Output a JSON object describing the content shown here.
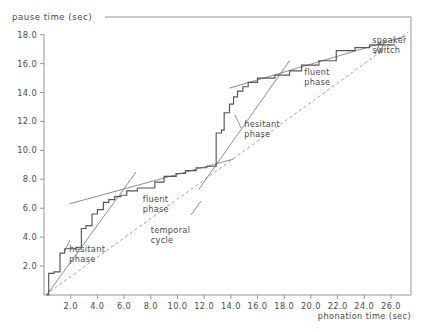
{
  "chart_data": {
    "type": "line",
    "title": "pause time (sec)",
    "xlabel": "phonation time (sec)",
    "ylabel": "pause time (sec)",
    "xlim": [
      0,
      27.5
    ],
    "ylim": [
      0,
      18.6
    ],
    "grid": false,
    "legend": null,
    "xticks": [
      "2.0",
      "4.0",
      "6.0",
      "8.0",
      "10.0",
      "12.0",
      "14.0",
      "16.0",
      "18.0",
      "20.0",
      "22.0",
      "24.0",
      "26.0"
    ],
    "xtick_values": [
      2,
      4,
      6,
      8,
      10,
      12,
      14,
      16,
      18,
      20,
      22,
      24,
      26
    ],
    "yticks": [
      "2.0",
      "4.0",
      "6.0",
      "8.0",
      "10.0",
      "12.0",
      "14.0",
      "16.0",
      "18.0"
    ],
    "ytick_values": [
      2,
      4,
      6,
      8,
      10,
      12,
      14,
      16,
      18
    ],
    "series": [
      {
        "name": "cumulative pause vs phonation (staircase)",
        "style": "step",
        "x": [
          0.2,
          0.35,
          0.35,
          0.75,
          0.75,
          1.2,
          1.2,
          1.55,
          1.55,
          2.4,
          2.4,
          2.8,
          2.8,
          3.15,
          3.15,
          3.6,
          3.6,
          4.0,
          4.0,
          4.45,
          4.45,
          4.85,
          4.85,
          5.3,
          5.3,
          5.75,
          5.75,
          6.2,
          6.2,
          7.0,
          7.0,
          8.3,
          8.3,
          9.0,
          9.0,
          9.9,
          9.9,
          10.6,
          10.6,
          11.4,
          11.4,
          12.2,
          12.2,
          12.9,
          12.9,
          13.3,
          13.3,
          13.5,
          13.5,
          13.9,
          13.9,
          14.2,
          14.2,
          14.5,
          14.5,
          14.9,
          14.9,
          15.3,
          15.3,
          16.0,
          16.0,
          17.3,
          17.3,
          18.4,
          18.4,
          19.3,
          19.3,
          20.6,
          20.6,
          21.9,
          21.9,
          23.3,
          23.3,
          24.4,
          24.4,
          26.3
        ],
        "y": [
          0.0,
          0.0,
          1.5,
          1.5,
          1.6,
          1.6,
          2.9,
          2.9,
          3.2,
          3.2,
          3.3,
          3.3,
          4.6,
          4.6,
          4.8,
          4.8,
          5.6,
          5.6,
          5.9,
          5.9,
          6.4,
          6.4,
          6.6,
          6.6,
          6.8,
          6.8,
          6.9,
          6.9,
          7.2,
          7.2,
          7.4,
          7.4,
          7.8,
          7.8,
          8.2,
          8.2,
          8.4,
          8.4,
          8.6,
          8.6,
          8.8,
          8.8,
          8.9,
          8.9,
          11.2,
          11.2,
          11.4,
          11.4,
          12.6,
          12.6,
          13.2,
          13.2,
          13.7,
          13.7,
          14.1,
          14.1,
          14.4,
          14.4,
          14.7,
          14.7,
          15.0,
          15.0,
          15.2,
          15.2,
          15.5,
          15.5,
          15.9,
          15.9,
          16.2,
          16.2,
          16.9,
          16.9,
          17.1,
          17.1,
          17.3,
          17.3
        ]
      },
      {
        "name": "temporal cycle (reference line)",
        "style": "dashed",
        "x": [
          0.1,
          27.3
        ],
        "y": [
          0.0,
          18.2
        ]
      },
      {
        "name": "hesitant phase regression 1",
        "style": "thin-solid",
        "x": [
          0.2,
          6.9
        ],
        "y": [
          0.0,
          8.5
        ]
      },
      {
        "name": "fluent phase regression 1",
        "style": "thin-solid",
        "x": [
          1.9,
          14.2
        ],
        "y": [
          6.3,
          9.4
        ]
      },
      {
        "name": "hesitant phase regression 2",
        "style": "thin-solid",
        "x": [
          11.6,
          18.4
        ],
        "y": [
          7.3,
          16.2
        ]
      },
      {
        "name": "fluent phase regression 2",
        "style": "thin-solid",
        "x": [
          13.9,
          27.1
        ],
        "y": [
          14.3,
          17.9
        ]
      }
    ],
    "annotations": [
      {
        "text": "hesitant phase",
        "id": "hesitant-phase-1",
        "x": 1.9,
        "y": 3.0
      },
      {
        "text": "fluent phase",
        "id": "fluent-phase-1",
        "x": 7.4,
        "y": 6.4
      },
      {
        "text": "temporal cycle",
        "id": "temporal-cycle",
        "x": 8.0,
        "y": 4.3
      },
      {
        "text": "hesitant phase",
        "id": "hesitant-phase-2",
        "x": 15.0,
        "y": 11.6
      },
      {
        "text": "fluent phase",
        "id": "fluent-phase-2",
        "x": 19.5,
        "y": 15.2
      },
      {
        "text": "speaker switch",
        "id": "speaker-switch",
        "x": 24.6,
        "y": 17.4
      }
    ]
  },
  "colors": {
    "frame": "#8a8a8a",
    "step_line": "#555555",
    "thin_line": "#6e6e6e",
    "dashed_line": "#8d8d8d",
    "text": "#4a4a4a",
    "background": "#ffffff"
  }
}
